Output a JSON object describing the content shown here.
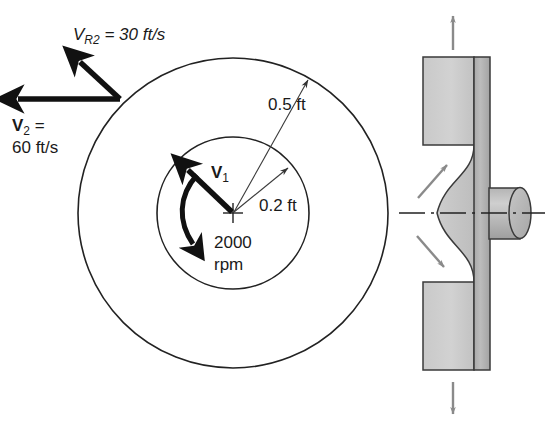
{
  "figure": {
    "background_color": "#ffffff",
    "width": 554,
    "height": 426
  },
  "labels": {
    "v_r2": {
      "symbol": "V",
      "subscript": "R2",
      "equals_value": " = 30 ft/s",
      "full_text": "V_R2 = 30 ft/s",
      "value": 30,
      "unit": "ft/s"
    },
    "v_2": {
      "symbol": "V",
      "subscript": "2",
      "equals": " =",
      "value_line": "60 ft/s",
      "value": 60,
      "unit": "ft/s"
    },
    "v_1": {
      "symbol": "V",
      "subscript": "1"
    },
    "outer_radius": {
      "text": "0.5 ft",
      "value": 0.5,
      "unit": "ft"
    },
    "inner_radius": {
      "text": "0.2 ft",
      "value": 0.2,
      "unit": "ft"
    },
    "rotation": {
      "line1": "2000",
      "line2": "rpm",
      "value": 2000,
      "unit": "rpm"
    }
  },
  "geometry": {
    "center_x": 233,
    "center_y": 213,
    "outer_circle_radius": 155,
    "inner_circle_radius": 76
  },
  "colors": {
    "line": "#222222",
    "vector": "#111111",
    "gray_arrow": "#8a8a8a",
    "fill_light": "#cfcfcf",
    "fill_mid": "#bdbdbd",
    "fill_dark": "#ababab"
  },
  "section_view": {
    "name": "nozzle-cross-section",
    "arrows": [
      {
        "name": "outflow-arrow-top",
        "direction": "up"
      },
      {
        "name": "outflow-arrow-bottom",
        "direction": "down"
      },
      {
        "name": "flow-arrow-upper",
        "direction": "up-right"
      },
      {
        "name": "flow-arrow-lower",
        "direction": "down-right"
      }
    ],
    "parts": [
      {
        "name": "shroud-block-upper"
      },
      {
        "name": "shroud-block-lower"
      },
      {
        "name": "impeller-plate"
      },
      {
        "name": "inlet-pipe"
      },
      {
        "name": "bell-mouth-inlet"
      },
      {
        "name": "axis-centerline"
      }
    ]
  }
}
